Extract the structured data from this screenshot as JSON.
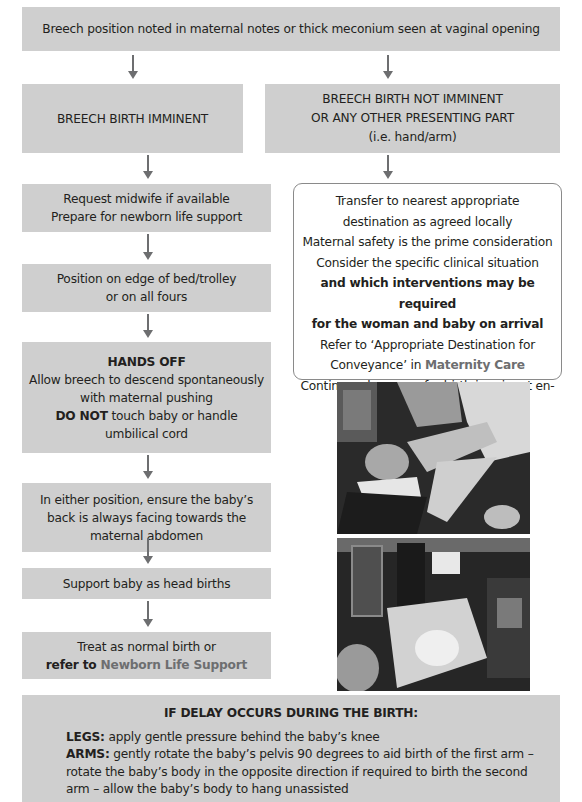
{
  "flowchart": {
    "start": "Breech position noted in maternal notes or thick meconium seen at vaginal opening",
    "left_branch": {
      "header": "BREECH BIRTH IMMINENT",
      "steps": [
        {
          "lines": [
            "Request midwife if available",
            "Prepare for newborn life support"
          ]
        },
        {
          "lines": [
            "Position on edge of bed/trolley",
            "or on all fours"
          ]
        },
        {
          "title": "HANDS OFF",
          "lines": [
            "Allow breech to descend spontaneously",
            "with maternal pushing"
          ],
          "bold_prefix": "DO NOT",
          "after_bold": " touch baby or handle",
          "last_line": "umbilical cord"
        },
        {
          "lines": [
            "In either position, ensure the baby’s",
            "back is always facing towards the",
            "maternal abdomen"
          ]
        },
        {
          "lines": [
            "Support baby as head births"
          ]
        },
        {
          "line1": "Treat as normal birth or",
          "bold_prefix": "refer to ",
          "link": "Newborn Life Support"
        }
      ]
    },
    "right_branch": {
      "header_lines": [
        "BREECH BIRTH NOT IMMINENT",
        "OR ANY OTHER PRESENTING PART",
        "(i.e. hand/arm)"
      ],
      "info": {
        "lines": [
          "Transfer to nearest appropriate",
          "destination as agreed locally",
          "Maternal safety is the prime consideration",
          "Consider the specific clinical situation"
        ],
        "bold_lines": [
          "and which interventions may be required",
          "for the woman and baby on arrival"
        ],
        "refer_line": "Refer to ‘Appropriate Destination for",
        "conveyance_prefix": "Conveyance’ in ",
        "conveyance_link": "Maternity Care",
        "final_line": "Continuously assess for birth imminent en-route"
      },
      "photos": [
        {
          "alt": "Clinicians assisting a woman during breech birth on a trolley (black and white photo)"
        },
        {
          "alt": "Clinician supporting a newborn inside an ambulance (black and white photo)"
        }
      ]
    },
    "delay": {
      "title": "IF DELAY OCCURS DURING THE BIRTH:",
      "legs_label": "LEGS:",
      "legs_text": " apply gentle pressure behind the baby’s knee",
      "arms_label": "ARMS:",
      "arms_text": " gently rotate the baby’s pelvis 90 degrees to aid birth of the first arm – rotate the baby’s body in the opposite direction if required to birth the second arm – allow the baby’s body to hang unassisted"
    }
  },
  "colors": {
    "box_fill": "#cfcfcf",
    "arrow": "#6d6e70",
    "link_text": "#6d6e70",
    "text": "#231f20"
  }
}
